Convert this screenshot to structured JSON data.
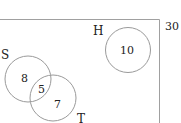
{
  "diagram": {
    "type": "venn",
    "universal_total": "30",
    "sets": [
      {
        "name": "S",
        "only_count": "8"
      },
      {
        "name": "T",
        "only_count": "7"
      },
      {
        "name": "H",
        "only_count": "10"
      }
    ],
    "intersections": [
      {
        "sets": [
          "S",
          "T"
        ],
        "count": "5"
      }
    ],
    "colors": {
      "outline": "#9a9a9a",
      "text": "#222222",
      "background": "#ffffff"
    }
  }
}
